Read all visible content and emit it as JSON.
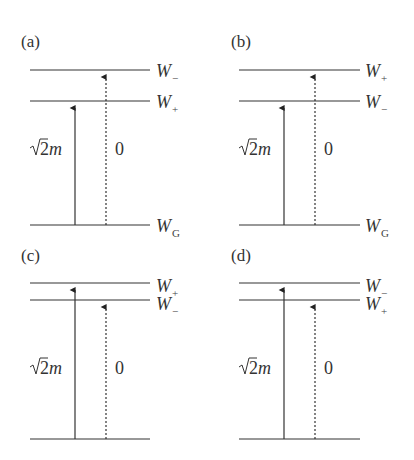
{
  "figure": {
    "panels": [
      {
        "id": "a",
        "label": "(a)",
        "levels": [
          {
            "name": "W",
            "sub": "−",
            "role": "upper"
          },
          {
            "name": "W",
            "sub": "+",
            "role": "middle"
          },
          {
            "name": "W",
            "sub": "G",
            "role": "ground"
          }
        ],
        "solid_arrow_label": "√2m",
        "solid_arrow_target": "W+",
        "dashed_arrow_label": "0",
        "dashed_arrow_target": "W−"
      },
      {
        "id": "b",
        "label": "(b)",
        "levels": [
          {
            "name": "W",
            "sub": "+",
            "role": "upper"
          },
          {
            "name": "W",
            "sub": "−",
            "role": "middle"
          },
          {
            "name": "W",
            "sub": "G",
            "role": "ground"
          }
        ],
        "solid_arrow_label": "√2m",
        "solid_arrow_target": "W−",
        "dashed_arrow_label": "0",
        "dashed_arrow_target": "W+"
      },
      {
        "id": "c",
        "label": "(c)",
        "levels": [
          {
            "name": "W",
            "sub": "+",
            "role": "upper"
          },
          {
            "name": "W",
            "sub": "−",
            "role": "middle"
          },
          {
            "name": "",
            "sub": "",
            "role": "ground"
          }
        ],
        "solid_arrow_label": "√2m",
        "solid_arrow_target": "W+",
        "dashed_arrow_label": "0",
        "dashed_arrow_target": "W−"
      },
      {
        "id": "d",
        "label": "(d)",
        "levels": [
          {
            "name": "W",
            "sub": "−",
            "role": "upper"
          },
          {
            "name": "W",
            "sub": "+",
            "role": "middle"
          },
          {
            "name": "",
            "sub": "",
            "role": "ground"
          }
        ],
        "solid_arrow_label": "√2m",
        "solid_arrow_target": "W−",
        "dashed_arrow_label": "0",
        "dashed_arrow_target": "W+"
      }
    ],
    "symbols": {
      "sqrt": "√",
      "two": "2",
      "m": "m"
    }
  }
}
